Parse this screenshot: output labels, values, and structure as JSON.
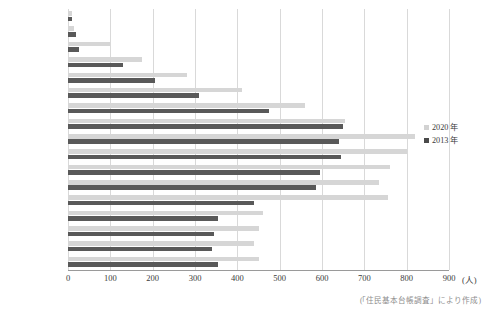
{
  "chart_data": {
    "type": "bar",
    "orientation": "horizontal",
    "title": "",
    "subtitle": "",
    "xlabel": "(人)",
    "ylabel": "",
    "xlim": [
      0,
      900
    ],
    "xticks": [
      0,
      100,
      200,
      300,
      400,
      500,
      600,
      700,
      800,
      900
    ],
    "xtick_labels": [
      "0",
      "100",
      "200",
      "300",
      "400",
      "500",
      "600",
      "700",
      "800",
      "900"
    ],
    "unit_label": "(人)",
    "grid": true,
    "grid_axis": "x",
    "legend_position": "right",
    "categories": [
      "80 歳以上",
      "75～79 歳",
      "70～74 歳",
      "65～69 歳",
      "60～64 歳",
      "55～59 歳",
      "50～54 歳",
      "45～49 歳",
      "40～44 歳",
      "35～39 歳",
      "30～34 歳",
      "25～29 歳",
      "20～24 歳",
      "15～19 歳",
      "10～14 歳",
      "5 ～ 9 歳",
      "0 ～ 4 歳"
    ],
    "series": [
      {
        "name": "2020 年",
        "color": "#d6d6d6",
        "values": [
          10,
          15,
          100,
          175,
          280,
          410,
          560,
          655,
          820,
          800,
          760,
          735,
          755,
          460,
          450,
          440,
          450
        ]
      },
      {
        "name": "2013 年",
        "color": "#595959",
        "values": [
          10,
          18,
          25,
          130,
          205,
          310,
          475,
          650,
          640,
          645,
          595,
          585,
          440,
          355,
          345,
          340,
          355
        ]
      }
    ],
    "source_note": "(「住民基本台帳調査」により作成)"
  },
  "legend": {
    "items": [
      {
        "label": "2020 年",
        "swatch_class": "sw-2020"
      },
      {
        "label": "2013 年",
        "swatch_class": "sw-2013"
      }
    ]
  }
}
